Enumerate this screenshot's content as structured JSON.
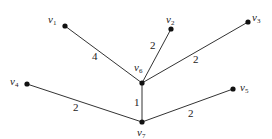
{
  "graph": {
    "nodes": [
      {
        "id": "v1",
        "label": "v",
        "sub": "1",
        "x": 65,
        "y": 26,
        "lx": 48,
        "ly": 14
      },
      {
        "id": "v2",
        "label": "v",
        "sub": "2",
        "x": 171,
        "y": 29,
        "lx": 166,
        "ly": 14
      },
      {
        "id": "v3",
        "label": "v",
        "sub": "3",
        "x": 248,
        "y": 22,
        "lx": 252,
        "ly": 12
      },
      {
        "id": "v4",
        "label": "v",
        "sub": "4",
        "x": 27,
        "y": 84,
        "lx": 10,
        "ly": 76
      },
      {
        "id": "v5",
        "label": "v",
        "sub": "5",
        "x": 233,
        "y": 89,
        "lx": 240,
        "ly": 82
      },
      {
        "id": "v6",
        "label": "v",
        "sub": "6",
        "x": 142,
        "y": 83,
        "lx": 134,
        "ly": 62
      },
      {
        "id": "v7",
        "label": "v",
        "sub": "7",
        "x": 142,
        "y": 122,
        "lx": 137,
        "ly": 127
      }
    ],
    "edges": [
      {
        "from": "v1",
        "to": "v6",
        "weight": "4",
        "wx": 92,
        "wy": 51
      },
      {
        "from": "v2",
        "to": "v6",
        "weight": "2",
        "wx": 150,
        "wy": 40
      },
      {
        "from": "v3",
        "to": "v6",
        "weight": "2",
        "wx": 193,
        "wy": 54
      },
      {
        "from": "v6",
        "to": "v7",
        "weight": "1",
        "wx": 134,
        "wy": 97
      },
      {
        "from": "v4",
        "to": "v7",
        "weight": "2",
        "wx": 73,
        "wy": 102
      },
      {
        "from": "v7",
        "to": "v5",
        "weight": "2",
        "wx": 188,
        "wy": 108
      }
    ]
  },
  "style": {
    "edge_color": "#333333",
    "node_color": "#111111"
  }
}
